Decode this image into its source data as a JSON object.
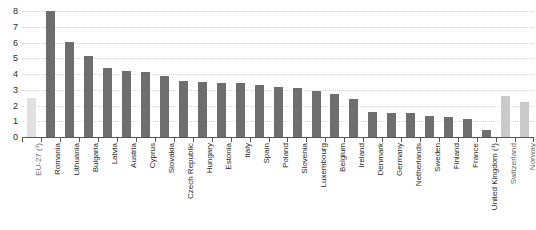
{
  "chart_data": {
    "type": "bar",
    "title": "",
    "xlabel": "",
    "ylabel": "",
    "ylim": [
      0,
      8
    ],
    "y_ticks": [
      0,
      1,
      2,
      3,
      4,
      5,
      6,
      7,
      8
    ],
    "grid": true,
    "legend": "none",
    "categories": [
      "EU-27 (¹)",
      "Romania",
      "Lithuania",
      "Bulgaria",
      "Latvia",
      "Austria",
      "Cyprus",
      "Slovakia",
      "Czech Republic",
      "Hungary",
      "Estonia",
      "Italy",
      "Spain",
      "Poland",
      "Slovenia",
      "Luxembourg",
      "Belgium",
      "Ireland",
      "Denmark",
      "Germany",
      "Netherlands",
      "Sweden",
      "Finland",
      "France",
      "United Kingdom (¹)",
      "Switzerland",
      "Norway"
    ],
    "values": [
      2.5,
      8.0,
      6.05,
      5.15,
      4.4,
      4.2,
      4.1,
      3.85,
      3.55,
      3.5,
      3.45,
      3.4,
      3.3,
      3.15,
      3.1,
      2.9,
      2.75,
      2.4,
      1.6,
      1.55,
      1.5,
      1.35,
      1.25,
      1.15,
      0.45,
      2.6,
      2.25
    ],
    "bar_kinds": [
      "aggregate",
      "member",
      "member",
      "member",
      "member",
      "member",
      "member",
      "member",
      "member",
      "member",
      "member",
      "member",
      "member",
      "member",
      "member",
      "member",
      "member",
      "member",
      "member",
      "member",
      "member",
      "member",
      "member",
      "member",
      "member",
      "nonmember",
      "nonmember"
    ],
    "colors": {
      "member_bar": "#6e6e6e",
      "aggregate_bar": "#e0e0e0",
      "nonmember_bar": "#c9c9c9",
      "gridline": "#d6d6d6",
      "axis": "#555555",
      "text": "#1f1f1f"
    }
  }
}
